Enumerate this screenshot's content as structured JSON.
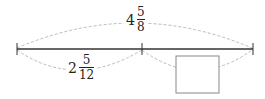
{
  "diagram": {
    "total": {
      "whole": "4",
      "numerator": "5",
      "denominator": "8"
    },
    "part_known": {
      "whole": "2",
      "numerator": "5",
      "denominator": "12"
    },
    "part_unknown": {
      "label": ""
    },
    "colors": {
      "line": "#333333",
      "arc": "#bbbbbb",
      "box": "#888888"
    }
  }
}
